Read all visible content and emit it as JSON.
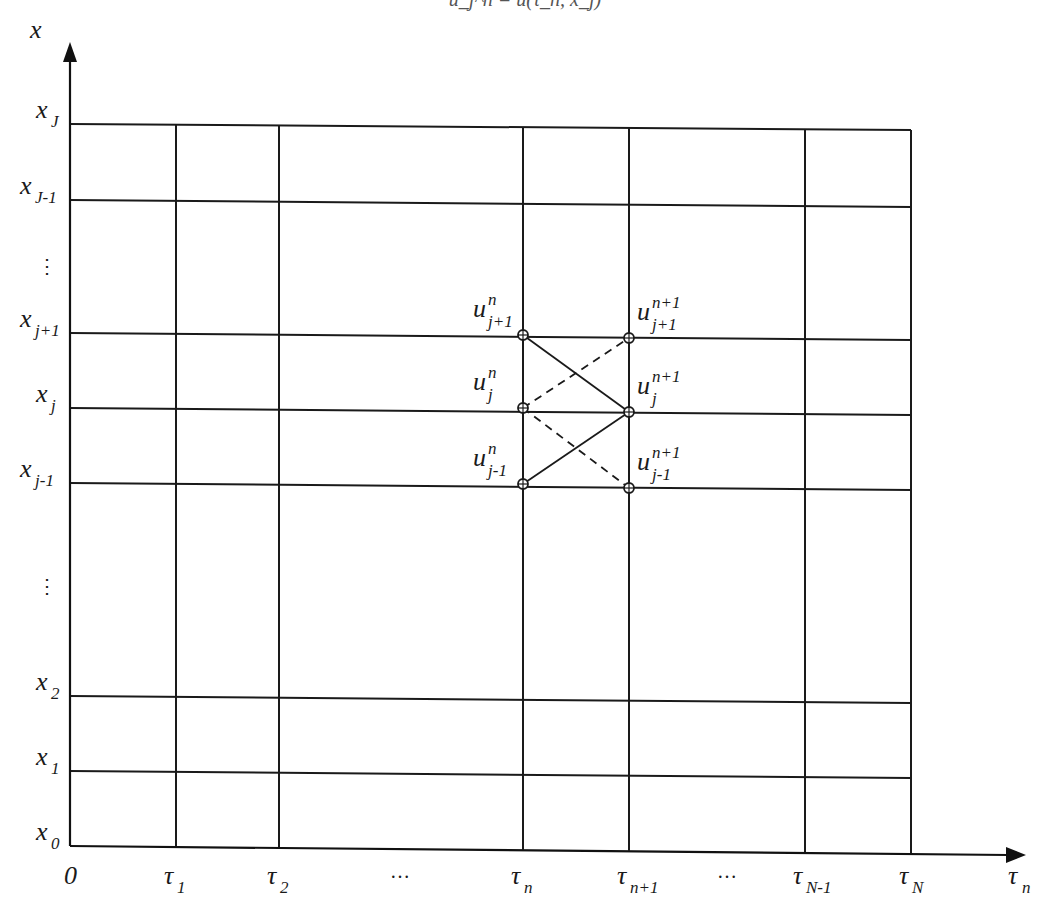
{
  "figure": {
    "top_caption": "u_j^n = u(τ_n, x_j)",
    "x_axis": {
      "label_main": "τ",
      "label_sub": "n",
      "origin_label": "0",
      "ticks": [
        {
          "main": "τ",
          "sub": "1",
          "x": 176
        },
        {
          "main": "τ",
          "sub": "2",
          "x": 279
        },
        {
          "main": "…",
          "sub": "",
          "x": 400,
          "ellipsis": true
        },
        {
          "main": "τ",
          "sub": "n",
          "x": 523
        },
        {
          "main": "τ",
          "sub": "n+1",
          "x": 629
        },
        {
          "main": "…",
          "sub": "",
          "x": 727,
          "ellipsis": true
        },
        {
          "main": "τ",
          "sub": "N-1",
          "x": 805
        },
        {
          "main": "τ",
          "sub": "N",
          "x": 911
        }
      ]
    },
    "y_axis": {
      "label_main": "x",
      "ticks": [
        {
          "main": "x",
          "sub": "J",
          "yL": 124,
          "yR": 130
        },
        {
          "main": "x",
          "sub": "J-1",
          "yL": 200,
          "yR": 207
        },
        {
          "main": "⋮",
          "sub": "",
          "yL": 265,
          "ellipsis": true
        },
        {
          "main": "x",
          "sub": "j+1",
          "yL": 333,
          "yR": 340
        },
        {
          "main": "x",
          "sub": "j",
          "yL": 408,
          "yR": 415
        },
        {
          "main": "x",
          "sub": "j-1",
          "yL": 483,
          "yR": 490
        },
        {
          "main": "⋮",
          "sub": "",
          "yL": 585,
          "ellipsis": true
        },
        {
          "main": "x",
          "sub": "2",
          "yL": 696,
          "yR": 703
        },
        {
          "main": "x",
          "sub": "1",
          "yL": 771,
          "yR": 778
        },
        {
          "main": "x",
          "sub": "0",
          "yL": 846,
          "yR": 853
        }
      ]
    },
    "stencil_nodes": [
      {
        "label": "u",
        "sup": "n",
        "sub": "j+1",
        "x": 523,
        "y": 335,
        "side": "left"
      },
      {
        "label": "u",
        "sup": "n",
        "sub": "j",
        "x": 523,
        "y": 408,
        "side": "left"
      },
      {
        "label": "u",
        "sup": "n",
        "sub": "j-1",
        "x": 523,
        "y": 484,
        "side": "left"
      },
      {
        "label": "u",
        "sup": "n+1",
        "sub": "j+1",
        "x": 629,
        "y": 338,
        "side": "right"
      },
      {
        "label": "u",
        "sup": "n+1",
        "sub": "j",
        "x": 629,
        "y": 412,
        "side": "right"
      },
      {
        "label": "u",
        "sup": "n+1",
        "sub": "j-1",
        "x": 629,
        "y": 488,
        "side": "right"
      }
    ],
    "stencil_edges": [
      {
        "from": 0,
        "to": 4,
        "style": "solid"
      },
      {
        "from": 2,
        "to": 4,
        "style": "solid"
      },
      {
        "from": 1,
        "to": 3,
        "style": "dashed"
      },
      {
        "from": 1,
        "to": 5,
        "style": "dashed"
      }
    ],
    "colors": {
      "line": "#1a1a1a",
      "background": "#ffffff"
    }
  }
}
